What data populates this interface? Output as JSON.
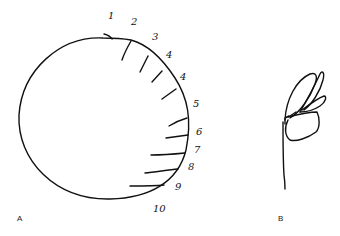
{
  "panels": [
    {
      "label": "A",
      "description": "Hand-drawn large circle with numbered radial tick marks along right edge",
      "tick_labels": [
        "1",
        "2",
        "3",
        "4",
        "4",
        "5",
        "6",
        "7",
        "8",
        "9",
        "10"
      ]
    },
    {
      "label": "B",
      "description": "Hand-drawn sketch of a flower bud with petals on a stem"
    }
  ],
  "colors": {
    "ink": "#111111",
    "background": "#ffffff"
  }
}
